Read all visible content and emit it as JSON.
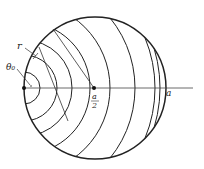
{
  "diagram": {
    "labels": {
      "r": "r",
      "theta0": "θ₀",
      "half_a_num": "a",
      "half_a_den": "2",
      "a": "a"
    },
    "geometry": {
      "circle": {
        "cx": 95,
        "cy": 88,
        "r": 71
      },
      "source_point": {
        "x": 24,
        "y": 88
      },
      "center_point": {
        "x": 94,
        "y": 88
      },
      "axis": {
        "x1": 24,
        "x2": 193,
        "y": 88
      },
      "arc_radii": [
        16,
        33,
        48,
        66,
        86,
        111,
        131,
        136
      ]
    },
    "colors": {
      "stroke": "#222222",
      "background": "#ffffff"
    }
  }
}
